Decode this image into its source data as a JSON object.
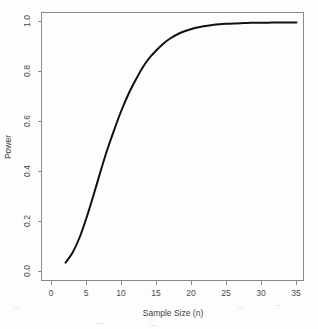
{
  "chart_data": {
    "type": "line",
    "title": "",
    "xlabel": "Sample Size (n)",
    "ylabel": "Power",
    "xlim": [
      0,
      35
    ],
    "ylim": [
      0.0,
      1.0
    ],
    "xticks": [
      0,
      5,
      10,
      15,
      20,
      25,
      30,
      35
    ],
    "xticklabels": [
      "0",
      "5",
      "10",
      "15",
      "20",
      "25",
      "30",
      "35"
    ],
    "yticks": [
      0.0,
      0.2,
      0.4,
      0.6,
      0.8,
      1.0
    ],
    "yticklabels": [
      "0.0",
      "0.2",
      "0.4",
      "0.6",
      "0.8",
      "1.0"
    ],
    "grid": false,
    "legend": null,
    "series": [
      {
        "name": "Power",
        "color": "#111111",
        "x": [
          2,
          3,
          4,
          5,
          6,
          7,
          8,
          9,
          10,
          11,
          12,
          13,
          14,
          15,
          16,
          17,
          18,
          19,
          20,
          21,
          22,
          23,
          24,
          25,
          26,
          27,
          28,
          29,
          30,
          31,
          32,
          33,
          34,
          35
        ],
        "values": [
          0.035,
          0.075,
          0.135,
          0.215,
          0.305,
          0.4,
          0.49,
          0.57,
          0.645,
          0.71,
          0.765,
          0.815,
          0.855,
          0.885,
          0.912,
          0.933,
          0.949,
          0.961,
          0.97,
          0.977,
          0.982,
          0.986,
          0.989,
          0.991,
          0.9925,
          0.9935,
          0.9942,
          0.9948,
          0.9952,
          0.9955,
          0.9958,
          0.996,
          0.9962,
          0.9963
        ]
      }
    ],
    "annotations": []
  },
  "axes": {
    "x_title": "Sample Size (n)",
    "y_title": "Power"
  }
}
